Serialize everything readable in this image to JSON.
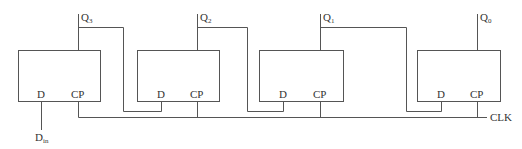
{
  "diagram": {
    "flipflops": [
      {
        "id": "ff3",
        "output": "Q",
        "output_sub": "3",
        "input_d": "D",
        "input_cp": "CP"
      },
      {
        "id": "ff2",
        "output": "Q",
        "output_sub": "2",
        "input_d": "D",
        "input_cp": "CP"
      },
      {
        "id": "ff1",
        "output": "Q",
        "output_sub": "1",
        "input_d": "D",
        "input_cp": "CP"
      },
      {
        "id": "ff0",
        "output": "Q",
        "output_sub": "0",
        "input_d": "D",
        "input_cp": "CP"
      }
    ],
    "data_input": {
      "label": "D",
      "sub": "in"
    },
    "clock": {
      "label": "CLK"
    },
    "colors": {
      "line": "#555555",
      "text": "#333333",
      "background": "#ffffff"
    }
  }
}
